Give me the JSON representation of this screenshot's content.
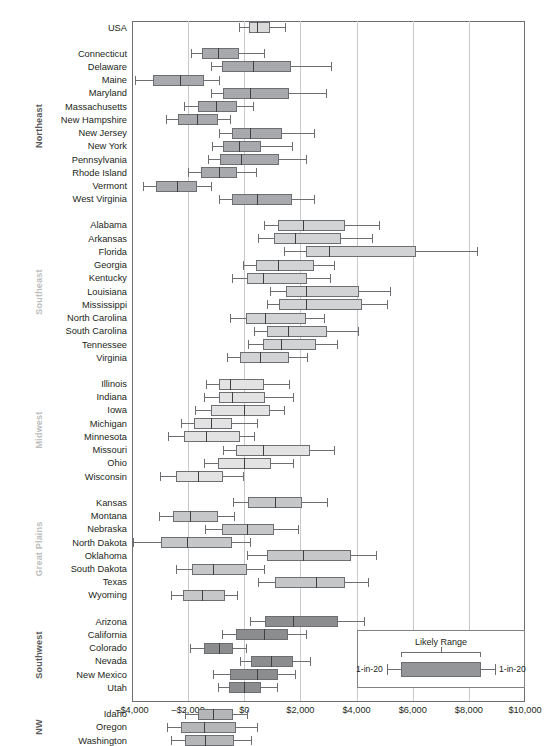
{
  "chart_data": {
    "type": "boxplot",
    "title": "",
    "xlabel": "",
    "ylabel": "",
    "xlim": [
      -4000,
      10000
    ],
    "xticks": [
      -4000,
      -2000,
      0,
      2000,
      4000,
      6000,
      8000,
      10000
    ],
    "xtick_labels": [
      "–$4,000",
      "–$2,000",
      "$0",
      "$2,000",
      "$4,000",
      "$6,000",
      "$8,000",
      "$10,000"
    ],
    "grid": "vertical",
    "box_spec": "box = likely range; whisker caps = 1-in-20 low and 1-in-20 high",
    "legend": {
      "position": "inset-bottom-right",
      "title": "Likely Range",
      "left_label": "1-in-20",
      "right_label": "1-in-20"
    },
    "colors": {
      "usa": "#d9dad9",
      "northeast": "#a7a9ac",
      "southeast": "#d2d3d4",
      "midwest": "#e2e3e2",
      "great_plains": "#c6c7c8",
      "southwest": "#8b8d8f",
      "nw": "#b4b6b7",
      "box_outline": "#6d6e71",
      "gridline": "#c9c9c9",
      "region_label_dark": "#58595b",
      "region_label_light": "#bcbec0"
    },
    "groups": [
      {
        "region": "",
        "region_style": "none",
        "rows": [
          {
            "name": "USA",
            "low": -200,
            "q1": 180,
            "median": 450,
            "q3": 900,
            "high": 1450
          }
        ]
      },
      {
        "region": "Northeast",
        "region_style": "dark",
        "rows": [
          {
            "name": "Connecticut",
            "low": -1900,
            "q1": -1500,
            "median": -950,
            "q3": -200,
            "high": 700
          },
          {
            "name": "Delaware",
            "low": -1200,
            "q1": -800,
            "median": 300,
            "q3": 1650,
            "high": 3100
          },
          {
            "name": "Maine",
            "low": -3900,
            "q1": -3250,
            "median": -2300,
            "q3": -1450,
            "high": -900
          },
          {
            "name": "Maryland",
            "low": -1200,
            "q1": -750,
            "median": 200,
            "q3": 1600,
            "high": 2900
          },
          {
            "name": "Massachusetts",
            "low": -2150,
            "q1": -1650,
            "median": -1000,
            "q3": -250,
            "high": 300
          },
          {
            "name": "New Hampshire",
            "low": -2800,
            "q1": -2350,
            "median": -1700,
            "q3": -950,
            "high": -500
          },
          {
            "name": "New Jersey",
            "low": -900,
            "q1": -450,
            "median": 200,
            "q3": 1350,
            "high": 2500
          },
          {
            "name": "New York",
            "low": -1150,
            "q1": -750,
            "median": -200,
            "q3": 600,
            "high": 1700
          },
          {
            "name": "Pennsylvania",
            "low": -1300,
            "q1": -850,
            "median": -100,
            "q3": 1250,
            "high": 2200
          },
          {
            "name": "Rhode Island",
            "low": -2000,
            "q1": -1550,
            "median": -900,
            "q3": -250,
            "high": 400
          },
          {
            "name": "Vermont",
            "low": -3600,
            "q1": -3150,
            "median": -2400,
            "q3": -1700,
            "high": -1200
          },
          {
            "name": "West Virginia",
            "low": -900,
            "q1": -450,
            "median": 450,
            "q3": 1700,
            "high": 2500
          }
        ]
      },
      {
        "region": "Southeast",
        "region_style": "light",
        "rows": [
          {
            "name": "Alabama",
            "low": 700,
            "q1": 1200,
            "median": 2100,
            "q3": 3600,
            "high": 4800
          },
          {
            "name": "Arkansas",
            "low": 500,
            "q1": 1050,
            "median": 1800,
            "q3": 3450,
            "high": 4550
          },
          {
            "name": "Florida",
            "low": 1400,
            "q1": 2200,
            "median": 3000,
            "q3": 6100,
            "high": 8300
          },
          {
            "name": "Georgia",
            "low": -50,
            "q1": 400,
            "median": 1200,
            "q3": 2500,
            "high": 3200
          },
          {
            "name": "Kentucky",
            "low": -450,
            "q1": 100,
            "median": 650,
            "q3": 2250,
            "high": 3050
          },
          {
            "name": "Louisiana",
            "low": 900,
            "q1": 1500,
            "median": 2200,
            "q3": 4100,
            "high": 5200
          },
          {
            "name": "Mississippi",
            "low": 800,
            "q1": 1250,
            "median": 2200,
            "q3": 4200,
            "high": 5100
          },
          {
            "name": "North Carolina",
            "low": -500,
            "q1": 50,
            "median": 750,
            "q3": 2200,
            "high": 2850
          },
          {
            "name": "South Carolina",
            "low": 350,
            "q1": 800,
            "median": 1550,
            "q3": 2950,
            "high": 4050
          },
          {
            "name": "Tennessee",
            "low": 150,
            "q1": 650,
            "median": 1300,
            "q3": 2550,
            "high": 3300
          },
          {
            "name": "Virginia",
            "low": -600,
            "q1": -150,
            "median": 550,
            "q3": 1600,
            "high": 2250
          }
        ]
      },
      {
        "region": "Midwest",
        "region_style": "light",
        "rows": [
          {
            "name": "Illinois",
            "low": -1350,
            "q1": -900,
            "median": -500,
            "q3": 700,
            "high": 1600
          },
          {
            "name": "Indiana",
            "low": -1450,
            "q1": -900,
            "median": -450,
            "q3": 750,
            "high": 1750
          },
          {
            "name": "Iowa",
            "low": -1750,
            "q1": -1200,
            "median": 0,
            "q3": 900,
            "high": 1400
          },
          {
            "name": "Michigan",
            "low": -2250,
            "q1": -1800,
            "median": -1200,
            "q3": -450,
            "high": 450
          },
          {
            "name": "Minnesota",
            "low": -2700,
            "q1": -2150,
            "median": -1350,
            "q3": -150,
            "high": 350
          },
          {
            "name": "Missouri",
            "low": -750,
            "q1": -300,
            "median": 650,
            "q3": 2350,
            "high": 3200
          },
          {
            "name": "Ohio",
            "low": -1450,
            "q1": -950,
            "median": 0,
            "q3": 950,
            "high": 1750
          },
          {
            "name": "Wisconsin",
            "low": -3000,
            "q1": -2450,
            "median": -1650,
            "q3": -750,
            "high": -50
          }
        ]
      },
      {
        "region": "Great Plains",
        "region_style": "light",
        "rows": [
          {
            "name": "Kansas",
            "low": -400,
            "q1": 150,
            "median": 1100,
            "q3": 2050,
            "high": 2950
          },
          {
            "name": "Montana",
            "low": -3050,
            "q1": -2550,
            "median": -1950,
            "q3": -950,
            "high": -350
          },
          {
            "name": "Nebraska",
            "low": -1400,
            "q1": -800,
            "median": 100,
            "q3": 1050,
            "high": 1900
          },
          {
            "name": "North Dakota",
            "low": -3950,
            "q1": -2950,
            "median": -2050,
            "q3": -450,
            "high": 200
          },
          {
            "name": "Oklahoma",
            "low": 100,
            "q1": 800,
            "median": 2100,
            "q3": 3800,
            "high": 4700
          },
          {
            "name": "South Dakota",
            "low": -2450,
            "q1": -1850,
            "median": -1100,
            "q3": 100,
            "high": 700
          },
          {
            "name": "Texas",
            "low": 500,
            "q1": 1100,
            "median": 2550,
            "q3": 3600,
            "high": 4400
          },
          {
            "name": "Wyoming",
            "low": -2600,
            "q1": -2200,
            "median": -1500,
            "q3": -700,
            "high": -250
          }
        ]
      },
      {
        "region": "Southwest",
        "region_style": "dark",
        "rows": [
          {
            "name": "Arizona",
            "low": 200,
            "q1": 750,
            "median": 1750,
            "q3": 3350,
            "high": 4250
          },
          {
            "name": "California",
            "low": -800,
            "q1": -300,
            "median": 700,
            "q3": 1550,
            "high": 2200
          },
          {
            "name": "Colorado",
            "low": -1950,
            "q1": -1450,
            "median": -900,
            "q3": -400,
            "high": 50
          },
          {
            "name": "Nevada",
            "low": -150,
            "q1": 250,
            "median": 950,
            "q3": 1750,
            "high": 2350
          },
          {
            "name": "New Mexico",
            "low": -1100,
            "q1": -500,
            "median": 450,
            "q3": 1200,
            "high": 1800
          },
          {
            "name": "Utah",
            "low": -950,
            "q1": -550,
            "median": 0,
            "q3": 600,
            "high": 1150
          }
        ]
      },
      {
        "region": "NW",
        "region_style": "dark",
        "rows": [
          {
            "name": "Idaho",
            "low": -2100,
            "q1": -1650,
            "median": -1100,
            "q3": -400,
            "high": 100
          },
          {
            "name": "Oregon",
            "low": -2750,
            "q1": -2250,
            "median": -1450,
            "q3": -300,
            "high": 450
          },
          {
            "name": "Washington",
            "low": -2600,
            "q1": -2100,
            "median": -1400,
            "q3": -350,
            "high": 250
          }
        ]
      }
    ]
  }
}
